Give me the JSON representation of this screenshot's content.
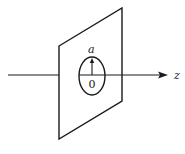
{
  "diagram": {
    "labels": {
      "radius": "a",
      "origin": "0",
      "axis": "z"
    },
    "colors": {
      "stroke": "#1a1a1a",
      "background": "#ffffff"
    }
  }
}
